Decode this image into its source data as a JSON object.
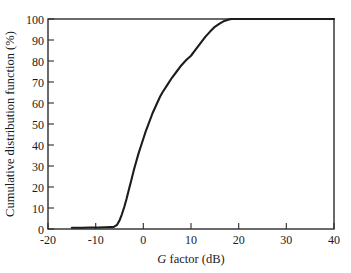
{
  "chart_data": {
    "type": "line",
    "title": "",
    "xlabel": "G factor (dB)",
    "xlabel_italic_part": "G",
    "xlabel_roman_part": "factor (dB)",
    "ylabel": "Cumulative distribution function (%)",
    "xlim": [
      -20,
      40
    ],
    "ylim": [
      0,
      100
    ],
    "xticks": [
      -20,
      -10,
      0,
      10,
      20,
      30,
      40
    ],
    "xtick_labels": [
      "-20",
      "-10",
      "0",
      "10",
      "20",
      "30",
      "40"
    ],
    "yticks": [
      0,
      10,
      20,
      30,
      40,
      50,
      60,
      70,
      80,
      90,
      100
    ],
    "ytick_labels": [
      "0",
      "10",
      "20",
      "30",
      "40",
      "50",
      "60",
      "70",
      "80",
      "90",
      "100"
    ],
    "grid": false,
    "legend": false,
    "legend_position": "none",
    "tick_direction": "in",
    "frame": "full-box",
    "series": [
      {
        "name": "Cumulative distribution function",
        "color": "#1c1c1c",
        "x": [
          -15.0,
          -13.0,
          -11.0,
          -9.5,
          -8.0,
          -7.0,
          -6.2,
          -5.5,
          -5.0,
          -4.5,
          -4.0,
          -3.5,
          -3.0,
          -2.5,
          -2.0,
          -1.5,
          -1.0,
          -0.5,
          0.0,
          0.5,
          1.0,
          1.5,
          2.0,
          2.5,
          3.0,
          3.5,
          4.0,
          5.0,
          6.0,
          7.0,
          8.0,
          9.0,
          10.0,
          11.0,
          12.0,
          13.0,
          14.0,
          15.0,
          16.0,
          17.0,
          17.8,
          18.5,
          20.0,
          25.0,
          30.0,
          35.0,
          40.0
        ],
        "y": [
          0.6,
          0.6,
          0.7,
          0.7,
          0.8,
          0.9,
          1.0,
          2.0,
          4.0,
          7.0,
          10.5,
          14.5,
          19.0,
          23.5,
          28.0,
          32.0,
          36.0,
          39.5,
          43.0,
          46.5,
          49.5,
          52.5,
          55.5,
          58.0,
          60.5,
          63.0,
          65.0,
          68.5,
          72.0,
          75.0,
          78.0,
          80.5,
          82.5,
          85.5,
          88.5,
          91.5,
          94.0,
          96.3,
          97.8,
          99.1,
          99.7,
          100.0,
          100.0,
          100.0,
          100.0,
          100.0,
          100.0
        ]
      }
    ],
    "annotations": []
  },
  "axes": {
    "x_title_italic": "G",
    "x_title_rest": " factor (dB)",
    "y_title": "Cumulative distribution function (%)"
  },
  "colors": {
    "background": "#ffffff",
    "axis": "#2b2b2b",
    "curve": "#1c1c1c",
    "text": "#1a1a1a"
  }
}
